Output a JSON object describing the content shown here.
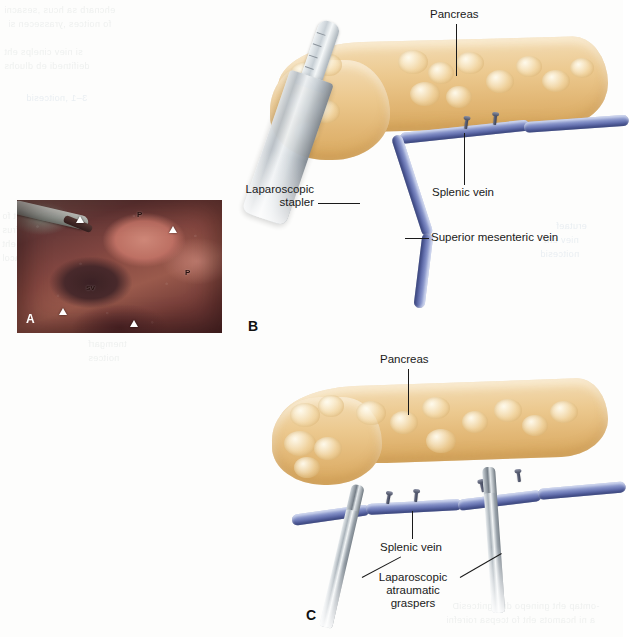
{
  "figure": {
    "panels": [
      {
        "letter": "A",
        "type": "intraoperative-photograph",
        "photo_labels": [
          {
            "text": "P",
            "meaning": "pancreas"
          },
          {
            "text": "P",
            "meaning": "pancreas"
          },
          {
            "text": "sv",
            "meaning": "splenic vein"
          }
        ]
      },
      {
        "letter": "B",
        "type": "line-illustration",
        "labels": [
          {
            "text": "Pancreas"
          },
          {
            "text": "Splenic vein"
          },
          {
            "text": "Superior mesenteric vein"
          },
          {
            "text": "Laparoscopic",
            "text2": "stapler"
          }
        ]
      },
      {
        "letter": "C",
        "type": "line-illustration",
        "labels": [
          {
            "text": "Pancreas"
          },
          {
            "text": "Splenic vein"
          },
          {
            "text": "Laparoscopic",
            "text2": "atraumatic",
            "text3": "graspers"
          }
        ]
      }
    ],
    "label_pancreas": "Pancreas",
    "label_splenic_vein": "Splenic vein",
    "label_smv": "Superior mesenteric vein",
    "label_stapler_l1": "Laparoscopic",
    "label_stapler_l2": "stapler",
    "label_graspers_l1": "Laparoscopic",
    "label_graspers_l2": "atraumatic",
    "label_graspers_l3": "graspers",
    "letter_a": "A",
    "letter_b": "B",
    "letter_c": "C",
    "photo_p1": "P",
    "photo_p2": "P",
    "photo_sv": "sv"
  },
  "colors": {
    "pancreas": "#ecc98f",
    "vein": "#7f8cc4",
    "instrument": "#b9c0c6",
    "label_text": "#1a1a1a",
    "page_background": "#fdfdfc"
  }
}
